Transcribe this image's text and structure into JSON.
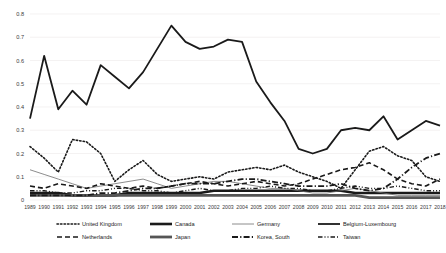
{
  "chart_data": {
    "type": "line",
    "title": "",
    "xlabel": "",
    "ylabel": "",
    "ylim": [
      0,
      0.8
    ],
    "grid": true,
    "legend_position": "bottom",
    "x": [
      1989,
      1990,
      1991,
      1992,
      1993,
      1994,
      1995,
      1996,
      1997,
      1998,
      1999,
      2000,
      2001,
      2002,
      2003,
      2004,
      2005,
      2006,
      2007,
      2008,
      2009,
      2010,
      2011,
      2012,
      2013,
      2014,
      2015,
      2016,
      2017,
      2018
    ],
    "ytick_labels": [
      "0",
      "0.1",
      "0.2",
      "0.3",
      "0.4",
      "0.5",
      "0.6",
      "0.7",
      "0.8"
    ],
    "ytick_values": [
      0,
      0.1,
      0.2,
      0.3,
      0.4,
      0.5,
      0.6,
      0.7,
      0.8
    ],
    "xtick_labels": [
      "1989",
      "1990",
      "1991",
      "1992",
      "1993",
      "1994",
      "1995",
      "1996",
      "1997",
      "1998",
      "1999",
      "2000",
      "2001",
      "2002",
      "2003",
      "2004",
      "2005",
      "2006",
      "2007",
      "2008",
      "2009",
      "2010",
      "2011",
      "2012",
      "2013",
      "2014",
      "2015",
      "2016",
      "2017",
      "2018"
    ],
    "series": [
      {
        "name": "United Kingdom",
        "style": "dotted",
        "width": 1.6,
        "color": "#1a1a1a",
        "values": [
          0.23,
          0.18,
          0.12,
          0.26,
          0.25,
          0.2,
          0.08,
          0.13,
          0.17,
          0.11,
          0.08,
          0.09,
          0.1,
          0.09,
          0.12,
          0.13,
          0.14,
          0.13,
          0.15,
          0.12,
          0.1,
          0.08,
          0.05,
          0.13,
          0.21,
          0.23,
          0.19,
          0.17,
          0.1,
          0.08
        ]
      },
      {
        "name": "Canada",
        "style": "solid-thick",
        "width": 2.6,
        "color": "#1a1a1a",
        "values": [
          0.03,
          0.03,
          0.03,
          0.02,
          0.02,
          0.02,
          0.02,
          0.03,
          0.03,
          0.03,
          0.03,
          0.03,
          0.03,
          0.04,
          0.04,
          0.04,
          0.04,
          0.04,
          0.04,
          0.04,
          0.04,
          0.04,
          0.04,
          0.03,
          0.03,
          0.03,
          0.03,
          0.03,
          0.03,
          0.03
        ]
      },
      {
        "name": "Germany",
        "style": "thin-solid",
        "width": 0.8,
        "color": "#6e6e6e",
        "values": [
          0.13,
          0.11,
          0.09,
          0.07,
          0.05,
          0.06,
          0.07,
          0.08,
          0.09,
          0.07,
          0.05,
          0.06,
          0.07,
          0.08,
          0.08,
          0.07,
          0.06,
          0.05,
          0.05,
          0.04,
          0.03,
          0.03,
          0.04,
          0.05,
          0.04,
          0.03,
          0.02,
          0.02,
          0.02,
          0.02
        ]
      },
      {
        "name": "Belgium-Luxembourg",
        "style": "solid",
        "width": 1.8,
        "color": "#1a1a1a",
        "values": [
          0.35,
          0.62,
          0.39,
          0.47,
          0.41,
          0.58,
          0.53,
          0.48,
          0.55,
          0.65,
          0.75,
          0.68,
          0.65,
          0.66,
          0.69,
          0.68,
          0.51,
          0.42,
          0.34,
          0.22,
          0.2,
          0.22,
          0.3,
          0.31,
          0.3,
          0.36,
          0.26,
          0.3,
          0.34,
          0.32
        ]
      },
      {
        "name": "Netherlands",
        "style": "dashed",
        "width": 1.6,
        "color": "#1a1a1a",
        "values": [
          0.06,
          0.05,
          0.07,
          0.06,
          0.05,
          0.07,
          0.06,
          0.05,
          0.06,
          0.05,
          0.06,
          0.07,
          0.08,
          0.07,
          0.06,
          0.07,
          0.08,
          0.07,
          0.06,
          0.07,
          0.09,
          0.11,
          0.13,
          0.14,
          0.16,
          0.13,
          0.09,
          0.07,
          0.06,
          0.09
        ]
      },
      {
        "name": "Japan",
        "style": "solid-thick",
        "width": 2.8,
        "color": "#555555",
        "values": [
          0.02,
          0.02,
          0.02,
          0.02,
          0.02,
          0.02,
          0.02,
          0.02,
          0.02,
          0.02,
          0.02,
          0.02,
          0.02,
          0.02,
          0.02,
          0.02,
          0.02,
          0.02,
          0.02,
          0.02,
          0.02,
          0.02,
          0.02,
          0.02,
          0.01,
          0.01,
          0.01,
          0.01,
          0.01,
          0.01
        ]
      },
      {
        "name": "Korea, South",
        "style": "dash-dot",
        "width": 1.8,
        "color": "#1a1a1a",
        "values": [
          0.02,
          0.02,
          0.02,
          0.02,
          0.02,
          0.03,
          0.03,
          0.04,
          0.05,
          0.05,
          0.06,
          0.07,
          0.07,
          0.07,
          0.08,
          0.09,
          0.09,
          0.08,
          0.07,
          0.06,
          0.06,
          0.06,
          0.07,
          0.05,
          0.04,
          0.05,
          0.09,
          0.14,
          0.18,
          0.2
        ]
      },
      {
        "name": "Taiwan",
        "style": "dash-dot-dot",
        "width": 1.4,
        "color": "#1a1a1a",
        "values": [
          0.04,
          0.04,
          0.03,
          0.03,
          0.04,
          0.04,
          0.05,
          0.05,
          0.04,
          0.04,
          0.03,
          0.04,
          0.05,
          0.04,
          0.04,
          0.05,
          0.05,
          0.06,
          0.05,
          0.05,
          0.04,
          0.04,
          0.05,
          0.06,
          0.05,
          0.05,
          0.06,
          0.05,
          0.04,
          0.04
        ]
      }
    ]
  },
  "legend": {
    "rows": [
      [
        "United Kingdom",
        "Canada",
        "Germany",
        "Belgium-Luxembourg"
      ],
      [
        "Netherlands",
        "Japan",
        "Korea, South",
        "Taiwan"
      ]
    ]
  }
}
